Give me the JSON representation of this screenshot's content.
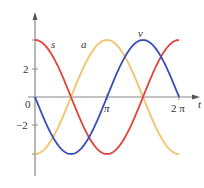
{
  "chart_data": {
    "type": "line",
    "title": "",
    "xlabel": "t",
    "ylabel": "",
    "xlim": [
      0,
      6.2832
    ],
    "ylim": [
      -4,
      4
    ],
    "grid": false,
    "x_ticks": [
      {
        "value": 0,
        "label": "0"
      },
      {
        "value": 3.1416,
        "label": "π"
      },
      {
        "value": 6.2832,
        "label": "2 π"
      }
    ],
    "y_ticks": [
      {
        "value": 2,
        "label": "2"
      },
      {
        "value": -2,
        "label": "−2"
      }
    ],
    "series": [
      {
        "name": "s",
        "color": "#e0453a",
        "formula": "4cos(t)",
        "x": [
          0,
          0.7854,
          1.5708,
          2.3562,
          3.1416,
          3.927,
          4.7124,
          5.4978,
          6.2832
        ],
        "values": [
          4,
          2.83,
          0,
          -2.83,
          -4,
          -2.83,
          0,
          2.83,
          4
        ]
      },
      {
        "name": "v",
        "color": "#3b4fb8",
        "formula": "-4sin(t)",
        "x": [
          0,
          0.7854,
          1.5708,
          2.3562,
          3.1416,
          3.927,
          4.7124,
          5.4978,
          6.2832
        ],
        "values": [
          0,
          -2.83,
          -4,
          -2.83,
          0,
          2.83,
          4,
          2.83,
          0
        ]
      },
      {
        "name": "a",
        "color": "#f5c26b",
        "formula": "-4cos(t)",
        "x": [
          0,
          0.7854,
          1.5708,
          2.3562,
          3.1416,
          3.927,
          4.7124,
          5.4978,
          6.2832
        ],
        "values": [
          -4,
          -2.83,
          0,
          2.83,
          4,
          2.83,
          0,
          -2.83,
          -4
        ]
      }
    ],
    "annotations": [
      {
        "text": "s",
        "near_series": "s"
      },
      {
        "text": "a",
        "near_series": "a"
      },
      {
        "text": "v",
        "near_series": "v"
      }
    ]
  },
  "labels": {
    "s": "s",
    "a": "a",
    "v": "v",
    "t": "t",
    "origin": "0",
    "pi": "π",
    "two_pi": "2 π",
    "y_pos2": "2",
    "y_neg2": "−2"
  }
}
